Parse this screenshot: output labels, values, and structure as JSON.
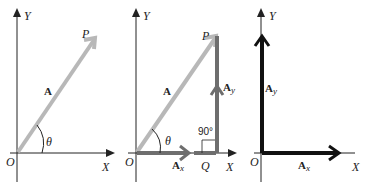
{
  "panels": [
    {
      "id": "vector",
      "axes": {
        "x_label": "X",
        "y_label": "Y",
        "origin_label": "O"
      },
      "vector_label": "A",
      "point_label": "P",
      "angle_label": "θ"
    },
    {
      "id": "components",
      "axes": {
        "x_label": "X",
        "y_label": "Y",
        "origin_label": "O"
      },
      "vector_label": "A",
      "point_label": "P",
      "angle_label": "θ",
      "foot_label": "Q",
      "right_angle_label": "90°",
      "x_component": {
        "base": "A",
        "sub": "x"
      },
      "y_component": {
        "base": "A",
        "sub": "y"
      }
    },
    {
      "id": "resolved",
      "axes": {
        "x_label": "X",
        "y_label": "Y",
        "origin_label": "O"
      },
      "x_component": {
        "base": "A",
        "sub": "x"
      },
      "y_component": {
        "base": "A",
        "sub": "y"
      }
    }
  ],
  "colors": {
    "axis": "#222222",
    "vector": "#b8b8b8",
    "component_gray": "#6e6e6e",
    "component_black": "#111111"
  }
}
